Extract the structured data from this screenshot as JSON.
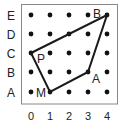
{
  "diagram": {
    "type": "coordinate-grid-polygon",
    "columns": [
      "0",
      "1",
      "2",
      "3",
      "4"
    ],
    "rows": [
      "A",
      "B",
      "C",
      "D",
      "E"
    ],
    "grid_points": "all intersections of columns 0-4 and rows A-E",
    "polygon": {
      "vertices": [
        {
          "label": "P",
          "col": "0",
          "row": "C"
        },
        {
          "label": "B",
          "col": "4",
          "row": "E"
        },
        {
          "label": "A",
          "col": "3",
          "row": "B"
        },
        {
          "label": "M",
          "col": "1",
          "row": "A"
        }
      ]
    },
    "colors": {
      "line": "#1a1a1a",
      "dot": "#111111",
      "border": "#888888",
      "text": "#222222"
    }
  }
}
